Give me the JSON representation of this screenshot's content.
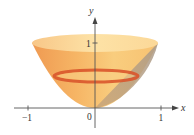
{
  "figure": {
    "type": "solid-of-revolution",
    "axes": {
      "x_label": "x",
      "y_label": "y",
      "origin_label": "0",
      "x_ticks": [
        {
          "label": "−1",
          "value": -1
        },
        {
          "label": "1",
          "value": 1
        }
      ],
      "y_ticks": [
        {
          "label": "1",
          "value": 1
        }
      ]
    },
    "colors": {
      "solid_light": "#fbd38a",
      "solid_mid": "#f6b463",
      "solid_dark": "#ee8f45",
      "ring": "#d9572c",
      "wedge_gray": "#b8a48e",
      "axis": "#555555"
    }
  }
}
